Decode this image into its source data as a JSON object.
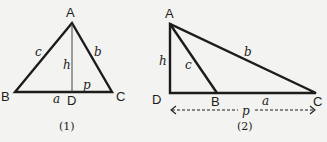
{
  "figures": [
    {
      "caption": "(1)",
      "vertices": {
        "A": "A",
        "B": "B",
        "C": "C",
        "D": "D"
      },
      "sides": {
        "a": "a",
        "b": "b",
        "c": "c",
        "h": "h",
        "p": "p"
      },
      "description": "Acute triangle ABC with altitude h from A to D on BC; p is segment DC"
    },
    {
      "caption": "(2)",
      "vertices": {
        "A": "A",
        "B": "B",
        "C": "C",
        "D": "D"
      },
      "sides": {
        "a": "a",
        "b": "b",
        "c": "c",
        "h": "h",
        "p": "p"
      },
      "description": "Obtuse triangle ABC with altitude h from A to D on extension of CB; p is dashed span DC"
    }
  ],
  "colors": {
    "background": "#f3f3f1",
    "ink": "#1c1c1c"
  }
}
